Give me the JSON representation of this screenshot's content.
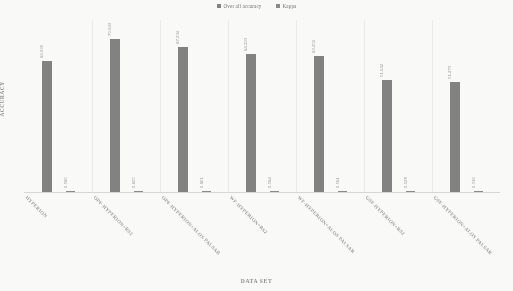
{
  "chart_data": {
    "type": "bar",
    "title": "",
    "xlabel": "DATA SET",
    "ylabel": "ACCURACY",
    "grid": false,
    "legend_position": "top-center",
    "ylim": [
      0,
      80
    ],
    "categories": [
      "HYPERION",
      "OPF-HYPERION+RS2",
      "OPF-HYPERION+ALOS PALSAR",
      "WF-HYPERION+RS2",
      "WF-HYPERION+ALOS PALSAR",
      "GSF-HYPERION+RS2",
      "GSF-HYPERION+ALOS PALSAR"
    ],
    "series": [
      {
        "name": "Over all accuracy",
        "color": "#7f7f7f",
        "values": [
          60.999,
          70.943,
          67.234,
          64.293,
          63.251,
          51.942,
          51.273
        ],
        "labels": [
          "60.999",
          "70.943",
          "67.234",
          "64.293",
          "63.251",
          "51.942",
          "51.273"
        ]
      },
      {
        "name": "Kappa",
        "color": "#888888",
        "values": [
          0.565,
          0.655,
          0.601,
          0.564,
          0.561,
          0.128,
          0.31
        ],
        "labels": [
          "0.565",
          "0.655",
          "0.601",
          "0.564",
          "0.561",
          "0.128",
          "0.310"
        ]
      }
    ]
  },
  "legend": {
    "entries": [
      {
        "label": "Over all accuracy",
        "color": "#7f7f7f"
      },
      {
        "label": "Kappa",
        "color": "#888888"
      }
    ]
  },
  "axes": {
    "y_title": "ACCURACY",
    "x_title": "DATA SET"
  }
}
